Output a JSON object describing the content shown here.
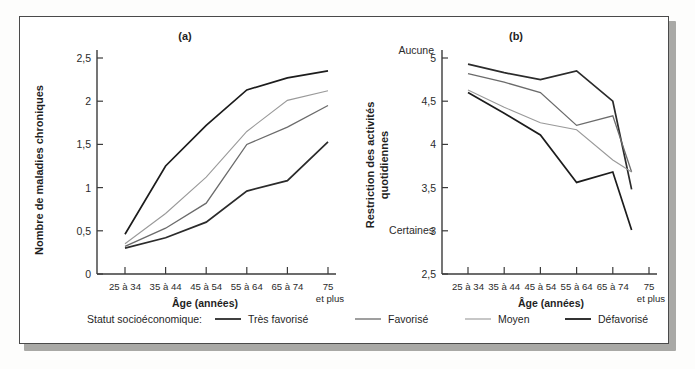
{
  "figure": {
    "panel_a_title": "(a)",
    "panel_b_title": "(b)",
    "legend_title": "Statut socioéconomique:"
  },
  "series_names": {
    "tres_favorise": "Très favorisé",
    "favorise": "Favorisé",
    "moyen": "Moyen",
    "defavorise": "Défavorisé"
  },
  "series_colors": {
    "tres_favorise": "#2b2b2b",
    "favorise": "#6b6b6b",
    "moyen": "#9a9a9a",
    "defavorise": "#1c1c1c"
  },
  "axis_titles": {
    "x": "Âge (années)",
    "y_a": "Nombre de maladies chroniques",
    "y_b_line1": "Restriction des activités",
    "y_b_line2": "quotidiennes"
  },
  "categories": [
    "25 à 34",
    "35 à 44",
    "45 à 54",
    "55 à 64",
    "65 à 74",
    "75"
  ],
  "last_category_suffix": "et plus",
  "yticks_a": [
    "0",
    "0,5",
    "1",
    "1,5",
    "2",
    "2,5"
  ],
  "yticks_b": [
    "2,5",
    "3",
    "3,5",
    "4",
    "4,5",
    "5"
  ],
  "b_endlabels": {
    "top": "Aucune",
    "low": "Certaines"
  },
  "chart_data": [
    {
      "type": "line",
      "title": "(a)",
      "xlabel": "Âge (années)",
      "ylabel": "Nombre de maladies chroniques",
      "categories": [
        "25 à 34",
        "35 à 44",
        "45 à 54",
        "55 à 64",
        "65 à 74",
        "75 et plus"
      ],
      "ylim": [
        0,
        2.5
      ],
      "yticks": [
        0,
        0.5,
        1,
        1.5,
        2,
        2.5
      ],
      "grid": false,
      "legend_position": "bottom",
      "series": [
        {
          "name": "Très favorisé",
          "color": "#2b2b2b",
          "values": [
            0.3,
            0.42,
            0.6,
            0.96,
            1.08,
            1.53
          ]
        },
        {
          "name": "Favorisé",
          "color": "#6b6b6b",
          "values": [
            0.32,
            0.53,
            0.82,
            1.5,
            1.7,
            1.95
          ]
        },
        {
          "name": "Moyen",
          "color": "#9a9a9a",
          "values": [
            0.35,
            0.7,
            1.12,
            1.65,
            2.01,
            2.12
          ]
        },
        {
          "name": "Défavorisé",
          "color": "#1c1c1c",
          "values": [
            0.46,
            1.25,
            1.72,
            2.13,
            2.27,
            2.35
          ]
        }
      ]
    },
    {
      "type": "line",
      "title": "(b)",
      "xlabel": "Âge (années)",
      "ylabel": "Restriction des activités quotidiennes",
      "categories": [
        "25 à 34",
        "35 à 44",
        "45 à 54",
        "55 à 64",
        "65 à 74",
        "75 et plus"
      ],
      "ylim": [
        2.5,
        5
      ],
      "yticks": [
        2.5,
        3,
        3.5,
        4,
        4.5,
        5
      ],
      "ytick_annotations": {
        "5": "Aucune",
        "3": "Certaines"
      },
      "grid": false,
      "legend_position": "bottom",
      "note": "Lines terminate midway between the 65 à 74 and 75 et plus ticks.",
      "series": [
        {
          "name": "Très favorisé",
          "color": "#2b2b2b",
          "values": [
            4.93,
            4.83,
            4.75,
            4.85,
            4.5,
            3.48
          ]
        },
        {
          "name": "Favorisé",
          "color": "#6b6b6b",
          "values": [
            4.82,
            4.72,
            4.6,
            4.22,
            4.33,
            3.68
          ]
        },
        {
          "name": "Moyen",
          "color": "#9a9a9a",
          "values": [
            4.63,
            4.43,
            4.25,
            4.17,
            3.82,
            3.68
          ]
        },
        {
          "name": "Défavorisé",
          "color": "#1c1c1c",
          "values": [
            4.6,
            4.36,
            4.11,
            3.56,
            3.68,
            3.01
          ]
        }
      ]
    }
  ]
}
